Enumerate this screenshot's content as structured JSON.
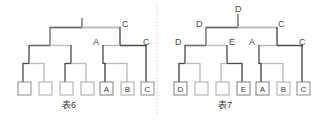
{
  "figure": {
    "kind": "two-binary-code-trees",
    "background": "#ffffff",
    "divider": {
      "name": "vertical-dotted-divider",
      "x": 157,
      "color": "#c9c9c9",
      "style": "dotted"
    }
  },
  "colors": {
    "dark_line": "#3a3a3a",
    "mid_line": "#6d6d6d",
    "light_line": "#b9b9b9",
    "box_stroke": "#8a8a8a",
    "box_fill": "#ffffff",
    "label_text": "#4a4a4a",
    "caption_text": "#3a3a3a",
    "divider": "#c9c9c9"
  },
  "left_tree": {
    "caption": "表6",
    "caption_x": 70,
    "caption_y": 100,
    "root_stem": {
      "x": 82,
      "y_top": 18,
      "y_bottom": 27
    },
    "node_labels": [
      {
        "name": "node-label-c-upper",
        "text": "C",
        "x": 122,
        "y": 24
      },
      {
        "name": "node-label-a",
        "text": "A",
        "x": 95,
        "y": 42
      },
      {
        "name": "node-label-c-lower",
        "text": "C",
        "x": 143,
        "y": 42
      }
    ],
    "leaf_boxes": [
      {
        "name": "leaf-box-1",
        "text": "",
        "x": 18,
        "y": 82
      },
      {
        "name": "leaf-box-2",
        "text": "",
        "x": 39,
        "y": 82
      },
      {
        "name": "leaf-box-3",
        "text": "",
        "x": 60,
        "y": 82
      },
      {
        "name": "leaf-box-4",
        "text": "",
        "x": 81,
        "y": 82
      },
      {
        "name": "leaf-box-a",
        "text": "A",
        "x": 100,
        "y": 82
      },
      {
        "name": "leaf-box-b",
        "text": "B",
        "x": 121,
        "y": 82
      },
      {
        "name": "leaf-box-c",
        "text": "C",
        "x": 141,
        "y": 82
      }
    ]
  },
  "right_tree": {
    "caption": "表7",
    "caption_x": 226,
    "caption_y": 100,
    "root_stem": {
      "x": 238,
      "y_top": 18,
      "y_bottom": 27
    },
    "node_labels": [
      {
        "name": "node-label-d-root",
        "text": "D",
        "x": 239,
        "y": 8
      },
      {
        "name": "node-label-d-level2",
        "text": "D",
        "x": 198,
        "y": 24
      },
      {
        "name": "node-label-c-upper",
        "text": "C",
        "x": 278,
        "y": 24
      },
      {
        "name": "node-label-d-level3",
        "text": "D",
        "x": 178,
        "y": 42
      },
      {
        "name": "node-label-e",
        "text": "E",
        "x": 228,
        "y": 42
      },
      {
        "name": "node-label-a",
        "text": "A",
        "x": 251,
        "y": 42
      },
      {
        "name": "node-label-c-lower",
        "text": "C",
        "x": 299,
        "y": 42
      }
    ],
    "leaf_boxes": [
      {
        "name": "leaf-box-d",
        "text": "D",
        "x": 174,
        "y": 82
      },
      {
        "name": "leaf-box-2",
        "text": "",
        "x": 195,
        "y": 82
      },
      {
        "name": "leaf-box-3",
        "text": "",
        "x": 216,
        "y": 82
      },
      {
        "name": "leaf-box-e",
        "text": "E",
        "x": 237,
        "y": 82
      },
      {
        "name": "leaf-box-a",
        "text": "A",
        "x": 256,
        "y": 82
      },
      {
        "name": "leaf-box-b",
        "text": "B",
        "x": 277,
        "y": 82
      },
      {
        "name": "leaf-box-c",
        "text": "C",
        "x": 297,
        "y": 82
      }
    ]
  }
}
